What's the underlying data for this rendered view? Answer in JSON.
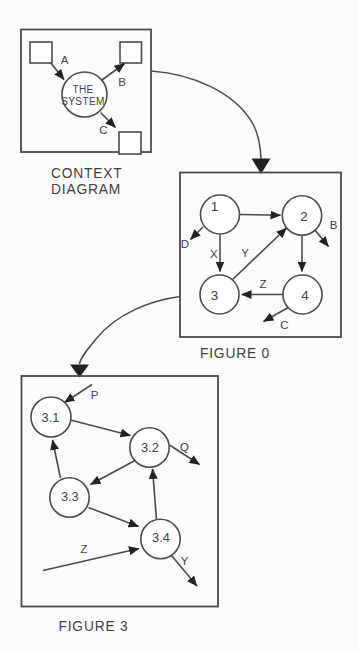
{
  "context_diagram": {
    "caption_lines": [
      "CONTEXT",
      "DIAGRAM"
    ],
    "system_label_lines": [
      "THE",
      "SYSTEM"
    ],
    "flow_labels": {
      "a": "A",
      "b": "B",
      "c": "C"
    }
  },
  "figure_0": {
    "caption": "FIGURE 0",
    "process_labels": [
      "1",
      "2",
      "3",
      "4"
    ],
    "flow_labels": {
      "d": "D",
      "x": "X",
      "y": "Y",
      "b": "B",
      "z": "Z",
      "c": "C"
    }
  },
  "figure_3": {
    "caption": "FIGURE 3",
    "process_labels": [
      "3.1",
      "3.2",
      "3.3",
      "3.4"
    ],
    "flow_labels": {
      "p": "P",
      "q": "Q",
      "z": "Z",
      "y": "Y"
    }
  },
  "colors": {
    "line": "#4b4b4b",
    "arrowhead": "#222222",
    "text": "#404040",
    "shape_fill": "#ffffff",
    "background": "#fcfcfc"
  }
}
